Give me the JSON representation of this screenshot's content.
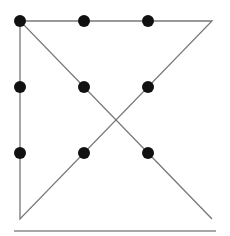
{
  "diagram": {
    "title": "",
    "colors": {
      "line": "#777777",
      "dot": "#111111",
      "rule": "#888888",
      "background": "#ffffff"
    },
    "dots": [
      {
        "x": 20,
        "y": 21
      },
      {
        "x": 84,
        "y": 21
      },
      {
        "x": 148,
        "y": 21
      },
      {
        "x": 20,
        "y": 87
      },
      {
        "x": 84,
        "y": 87
      },
      {
        "x": 148,
        "y": 87
      },
      {
        "x": 20,
        "y": 153
      },
      {
        "x": 84,
        "y": 153
      },
      {
        "x": 148,
        "y": 153
      }
    ],
    "path": [
      {
        "x": 212,
        "y": 219
      },
      {
        "x": 20,
        "y": 21
      },
      {
        "x": 212,
        "y": 21
      },
      {
        "x": 20,
        "y": 219
      },
      {
        "x": 20,
        "y": 21
      }
    ],
    "rule": {
      "x1": 14,
      "y1": 231,
      "x2": 216,
      "y2": 231
    }
  }
}
